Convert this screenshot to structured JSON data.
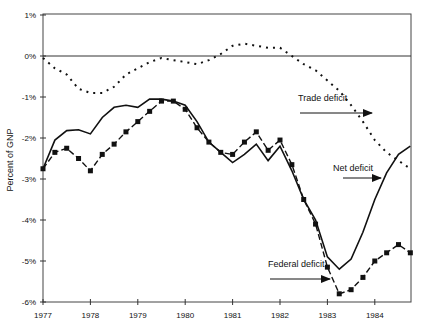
{
  "chart_data": {
    "type": "line",
    "title": "",
    "xlabel": "",
    "ylabel": "Percent of GNP",
    "xlim": [
      1977,
      1984.8
    ],
    "ylim": [
      -6,
      1
    ],
    "grid": false,
    "x_ticks": [
      "1977",
      "1978",
      "1979",
      "1980",
      "1981",
      "1982",
      "1983",
      "1984"
    ],
    "y_ticks": [
      "1%",
      "0%",
      "-1%",
      "-2%",
      "-3%",
      "-4%",
      "-5%",
      "-6%"
    ],
    "x": [
      1977.0,
      1977.25,
      1977.5,
      1977.75,
      1978.0,
      1978.25,
      1978.5,
      1978.75,
      1979.0,
      1979.25,
      1979.5,
      1979.75,
      1980.0,
      1980.25,
      1980.5,
      1980.75,
      1981.0,
      1981.25,
      1981.5,
      1981.75,
      1982.0,
      1982.25,
      1982.5,
      1982.75,
      1983.0,
      1983.25,
      1983.5,
      1983.75,
      1984.0,
      1984.25,
      1984.5,
      1984.75
    ],
    "series": [
      {
        "name": "Trade deficit",
        "style": "dotted",
        "values": [
          -0.05,
          -0.3,
          -0.45,
          -0.8,
          -0.9,
          -0.9,
          -0.75,
          -0.45,
          -0.3,
          -0.15,
          -0.05,
          -0.1,
          -0.15,
          -0.2,
          -0.1,
          0.05,
          0.25,
          0.3,
          0.25,
          0.2,
          0.2,
          0.0,
          -0.2,
          -0.35,
          -0.6,
          -0.85,
          -1.2,
          -1.6,
          -2.05,
          -2.35,
          -2.55,
          -2.75
        ]
      },
      {
        "name": "Net deficit",
        "style": "solid",
        "values": [
          -2.75,
          -2.05,
          -1.82,
          -1.8,
          -1.9,
          -1.5,
          -1.25,
          -1.2,
          -1.25,
          -1.05,
          -1.05,
          -1.1,
          -1.2,
          -1.6,
          -2.1,
          -2.35,
          -2.6,
          -2.4,
          -2.15,
          -2.55,
          -2.2,
          -2.8,
          -3.5,
          -4.0,
          -4.9,
          -5.2,
          -4.95,
          -4.3,
          -3.5,
          -2.85,
          -2.4,
          -2.2
        ]
      },
      {
        "name": "Federal deficit",
        "style": "dashed-square-markers",
        "values": [
          -2.75,
          -2.35,
          -2.25,
          -2.5,
          -2.8,
          -2.4,
          -2.15,
          -1.85,
          -1.6,
          -1.35,
          -1.1,
          -1.1,
          -1.3,
          -1.75,
          -2.1,
          -2.35,
          -2.4,
          -2.1,
          -1.85,
          -2.3,
          -2.05,
          -2.65,
          -3.5,
          -4.1,
          -5.15,
          -5.8,
          -5.7,
          -5.4,
          -5.0,
          -4.8,
          -4.6,
          -4.8
        ]
      }
    ],
    "annotations": [
      {
        "text": "Trade deficit",
        "series": "Trade deficit"
      },
      {
        "text": "Net deficit",
        "series": "Net deficit"
      },
      {
        "text": "Federal deficit",
        "series": "Federal deficit"
      }
    ],
    "legend_position": "inline-annotations"
  }
}
